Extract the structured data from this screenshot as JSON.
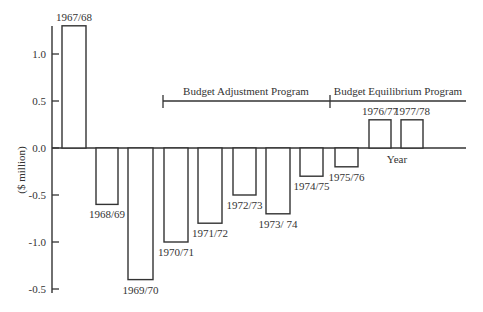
{
  "chart_data": {
    "type": "bar",
    "title": "",
    "xlabel": "Year",
    "ylabel": "($ million)",
    "ylim": [
      -1.5,
      1.3
    ],
    "y_ticks": [
      1.0,
      0.5,
      0.0,
      -0.5,
      -1.0,
      -1.5
    ],
    "y_tick_labels": [
      "1.0",
      "0.5",
      "0.0",
      "-0.5",
      "-1.0",
      "-0.5"
    ],
    "grid": false,
    "categories": [
      "1967/68",
      "1968/69",
      "1969/70",
      "1970/71",
      "1971/72",
      "1972/73",
      "1973/74",
      "1974/75",
      "1975/76",
      "1976/77",
      "1977/78"
    ],
    "category_labels": [
      "1967/68",
      "1968/69",
      "1969/70",
      "1970/71",
      "1971/72",
      "1972/73",
      "1973/ 74",
      "1974/75",
      "1975/76",
      "1976/77",
      "1977/78"
    ],
    "values": [
      1.3,
      -0.6,
      -1.4,
      -1.0,
      -0.8,
      -0.5,
      -0.7,
      -0.3,
      -0.2,
      0.3,
      0.3
    ],
    "annotations": [
      {
        "text": "Budget Adjustment Program",
        "from": "1970/71",
        "to": "1975/76"
      },
      {
        "text": "Budget Equilibrium Program",
        "from": "1975/76",
        "to": "1977/78"
      }
    ]
  },
  "labels": {
    "ylabel": "($ million)",
    "xlabel": "Year",
    "program1": "Budget Adjustment Program",
    "program2": "Budget Equilibrium Program"
  }
}
